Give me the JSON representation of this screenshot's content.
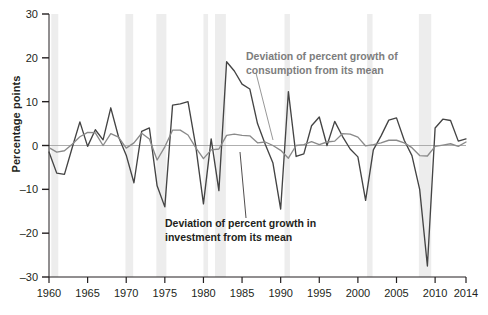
{
  "chart_data": {
    "type": "line",
    "title": "",
    "subtitle": "",
    "xlabel": "",
    "ylabel": "Percentage points",
    "xlim": [
      1960,
      2014
    ],
    "ylim": [
      -30,
      30
    ],
    "grid": false,
    "legend_position": "inline-annotations",
    "x_ticks": [
      1960,
      1965,
      1970,
      1975,
      1980,
      1985,
      1990,
      1995,
      2000,
      2005,
      2010,
      2014
    ],
    "x_tick_labels": [
      "1960",
      "1965",
      "1970",
      "1975",
      "1980",
      "1985",
      "1990",
      "1995",
      "2000",
      "2005",
      "2010",
      "2014"
    ],
    "y_ticks": [
      -30,
      -20,
      -10,
      0,
      10,
      20,
      30
    ],
    "y_tick_labels": [
      "–30",
      "–20",
      "–10",
      "0",
      "10",
      "20",
      "30"
    ],
    "zero_line": 0,
    "colors": {
      "investment": "#444444",
      "consumption": "#8a8a8a",
      "recession_band": "#ededed",
      "axis": "#231f20",
      "zero_line": "#9a9a9a"
    },
    "recession_bands": [
      {
        "start": 1960.3,
        "end": 1961.2
      },
      {
        "start": 1969.9,
        "end": 1970.9
      },
      {
        "start": 1973.9,
        "end": 1975.2
      },
      {
        "start": 1980.0,
        "end": 1980.6
      },
      {
        "start": 1981.5,
        "end": 1982.9
      },
      {
        "start": 1990.5,
        "end": 1991.2
      },
      {
        "start": 2001.2,
        "end": 2001.9
      },
      {
        "start": 2007.9,
        "end": 2009.5
      }
    ],
    "x": [
      1960,
      1961,
      1962,
      1963,
      1964,
      1965,
      1966,
      1967,
      1968,
      1969,
      1970,
      1971,
      1972,
      1973,
      1974,
      1975,
      1976,
      1977,
      1978,
      1979,
      1980,
      1981,
      1982,
      1983,
      1984,
      1985,
      1986,
      1987,
      1988,
      1989,
      1990,
      1991,
      1992,
      1993,
      1994,
      1995,
      1996,
      1997,
      1998,
      1999,
      2000,
      2001,
      2002,
      2003,
      2004,
      2005,
      2006,
      2007,
      2008,
      2009,
      2010,
      2011,
      2012,
      2013,
      2014
    ],
    "series": [
      {
        "name": "Deviation of percent growth in investment from its mean",
        "color": "#444444",
        "values": [
          -1.5,
          -6.3,
          -6.6,
          -0.5,
          5.4,
          -0.2,
          3.6,
          1.3,
          8.6,
          2.0,
          -2.2,
          -8.5,
          3.2,
          4.0,
          -9.2,
          -14.0,
          9.2,
          9.5,
          10.0,
          -0.1,
          -13.3,
          1.5,
          -10.3,
          19.1,
          17.0,
          14.0,
          12.9,
          5.0,
          0.3,
          -4.0,
          -14.5,
          12.3,
          -2.5,
          -1.9,
          4.5,
          6.5,
          0.0,
          5.5,
          2.1,
          -0.8,
          -2.6,
          -12.5,
          -1.0,
          2.2,
          5.8,
          6.3,
          1.2,
          -2.3,
          -10.0,
          -27.5,
          4.0,
          6.0,
          5.7,
          1.0,
          1.5
        ]
      },
      {
        "name": "Deviation of percent growth of consumption from its mean",
        "color": "#8a8a8a",
        "values": [
          -0.5,
          -1.5,
          -1.2,
          0.3,
          2.0,
          3.0,
          2.9,
          0.0,
          2.7,
          1.9,
          -0.6,
          0.6,
          2.8,
          1.5,
          -3.3,
          -0.3,
          3.5,
          3.5,
          2.4,
          -0.5,
          -3.0,
          -1.0,
          -0.8,
          2.3,
          2.6,
          2.3,
          2.2,
          0.6,
          0.8,
          0.0,
          -1.1,
          -2.9,
          0.0,
          0.2,
          0.9,
          0.2,
          0.8,
          1.0,
          2.7,
          2.6,
          1.9,
          -0.1,
          0.2,
          0.6,
          1.2,
          1.2,
          0.6,
          -0.5,
          -2.3,
          -2.4,
          -0.2,
          0.1,
          0.4,
          -0.2,
          0.8
        ]
      }
    ],
    "annotations": [
      {
        "id": "consumption-annotation",
        "line1": "Deviation of percent growth of",
        "line2": "consumption from its mean",
        "color": "#7d7d7d",
        "text_x": 246,
        "text_y": 60,
        "leader": {
          "x1": 256,
          "y1": 73,
          "x2": 273,
          "y2": 140
        }
      },
      {
        "id": "investment-annotation",
        "line1": "Deviation of percent growth in",
        "line2": "investment from its mean",
        "color": "#231f20",
        "text_x": 165,
        "text_y": 227,
        "leader": {
          "x1": 246,
          "y1": 218,
          "x2": 240,
          "y2": 152
        }
      }
    ]
  }
}
